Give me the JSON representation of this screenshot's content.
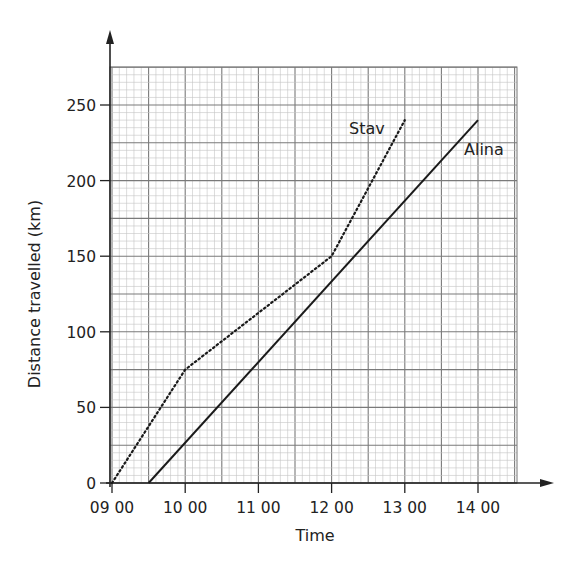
{
  "chart_data": {
    "type": "line",
    "title": "",
    "xlabel": "Time",
    "ylabel": "Distance travelled (km)",
    "x_ticks": [
      "09 00",
      "10 00",
      "11 00",
      "12 00",
      "13 00",
      "14 00"
    ],
    "y_ticks": [
      0,
      50,
      100,
      150,
      200,
      250
    ],
    "xlim_hours": [
      9,
      14.55
    ],
    "ylim": [
      0,
      275
    ],
    "grid": true,
    "series": [
      {
        "name": "Stav",
        "style": "dotted",
        "points": [
          [
            9.0,
            0
          ],
          [
            10.0,
            75
          ],
          [
            12.0,
            150
          ],
          [
            13.0,
            240
          ]
        ]
      },
      {
        "name": "Alina",
        "style": "solid",
        "points": [
          [
            9.5,
            0
          ],
          [
            14.0,
            240
          ]
        ]
      }
    ],
    "labels": {
      "stav": "Stav",
      "alina": "Alina"
    }
  }
}
